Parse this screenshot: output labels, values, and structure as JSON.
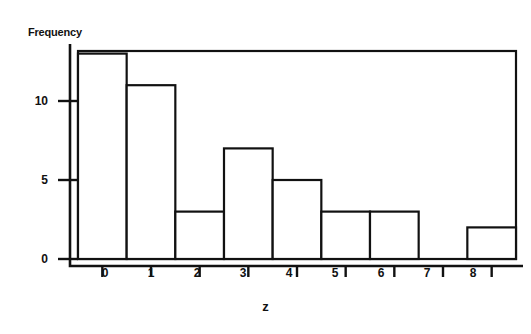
{
  "chart_data": {
    "type": "bar",
    "title": "",
    "xlabel": "z",
    "ylabel": "Frequency",
    "categories": [
      "0",
      "1",
      "2",
      "3",
      "4",
      "5",
      "6",
      "7",
      "8"
    ],
    "values": [
      13,
      11,
      3,
      7,
      5,
      3,
      3,
      0,
      2
    ],
    "xticklabels": [
      "0",
      "1",
      "2",
      "3",
      "4",
      "5",
      "6",
      "7",
      "8"
    ],
    "yticklabels": [
      "0",
      "5",
      "10"
    ],
    "ytickvalues": [
      0,
      5,
      10
    ],
    "xlim": [
      -0.5,
      8.5
    ],
    "ylim": [
      0,
      13.9
    ],
    "grid": false,
    "legend": false,
    "bar_facecolor": "#ffffff",
    "bar_edgecolor": "#111111",
    "axis_color": "#111111",
    "background": "#ffffff"
  }
}
